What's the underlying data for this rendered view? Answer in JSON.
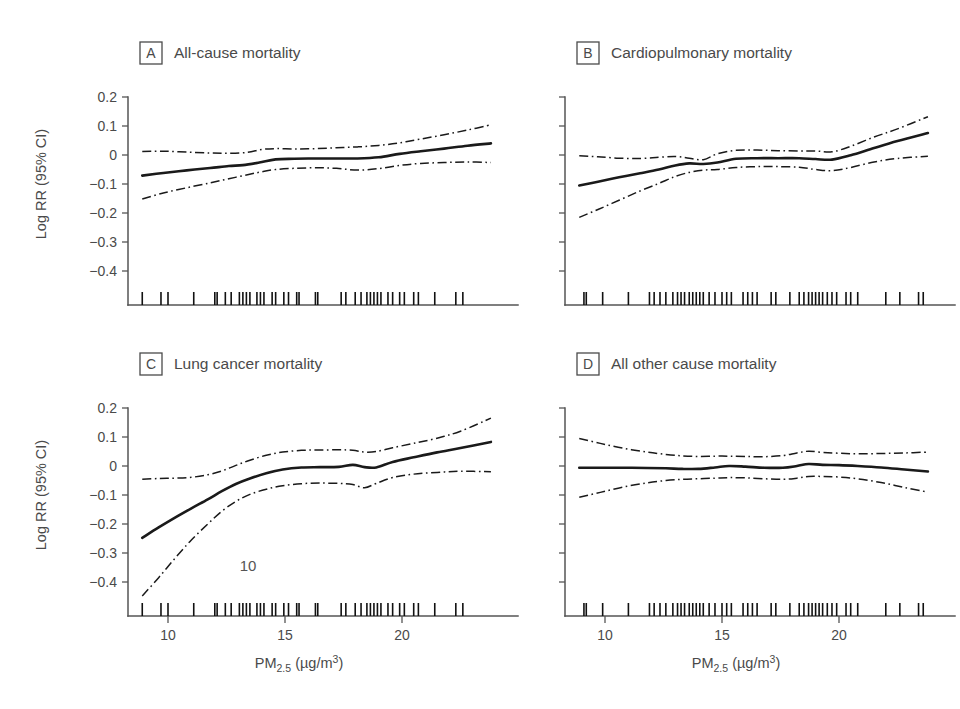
{
  "figure": {
    "background": "#ffffff",
    "line_color": "#1a1a1a",
    "text_color": "#4a4a4a",
    "stray_annotation": "10"
  },
  "axes": {
    "y_label": "Log RR (95% CI)",
    "x_label_main": "PM",
    "x_label_sub": "2.5",
    "x_label_units_open": " (µg/m",
    "x_label_units_sup": "3",
    "x_label_units_close": ")",
    "y_ticks": [
      "0.2",
      "0.1",
      "0",
      "−0.1",
      "−0.2",
      "−0.3",
      "−0.4"
    ],
    "y_tick_values": [
      0.2,
      0.1,
      0,
      -0.1,
      -0.2,
      -0.3,
      -0.4
    ],
    "x_ticks": [
      "10",
      "15",
      "20"
    ],
    "x_tick_values": [
      10,
      15,
      20
    ],
    "ylim": [
      -0.45,
      0.22
    ],
    "xlim": [
      8.4,
      24.4
    ],
    "grid": false,
    "legend": "none"
  },
  "chart_data": [
    {
      "id": "panel-a",
      "tag": "A",
      "title": "All-cause mortality",
      "type": "line",
      "xlabel": "PM2.5 (µg/m3)",
      "ylabel": "Log RR (95% CI)",
      "xlim": [
        8.4,
        24.4
      ],
      "ylim": [
        -0.45,
        0.22
      ],
      "series": [
        {
          "name": "Log RR estimate",
          "style": "solid",
          "x": [
            8.9,
            9.8,
            10.8,
            11.8,
            12.6,
            13.2,
            13.9,
            14.6,
            15.4,
            16.3,
            17.2,
            18.1,
            19.0,
            19.9,
            20.8,
            21.8,
            22.8,
            23.8
          ],
          "y": [
            -0.071,
            -0.062,
            -0.053,
            -0.045,
            -0.038,
            -0.035,
            -0.026,
            -0.015,
            -0.013,
            -0.012,
            -0.012,
            -0.012,
            -0.008,
            0.004,
            0.013,
            0.022,
            0.032,
            0.04
          ]
        },
        {
          "name": "Upper 95% CI",
          "style": "dashdot",
          "x": [
            8.9,
            9.8,
            10.8,
            11.8,
            12.6,
            13.4,
            14.0,
            14.6,
            15.4,
            16.3,
            17.2,
            18.1,
            19.0,
            19.9,
            20.8,
            21.8,
            22.8,
            23.8
          ],
          "y": [
            0.012,
            0.013,
            0.01,
            0.007,
            0.006,
            0.009,
            0.019,
            0.022,
            0.021,
            0.022,
            0.025,
            0.028,
            0.033,
            0.042,
            0.055,
            0.07,
            0.086,
            0.104
          ]
        },
        {
          "name": "Lower 95% CI",
          "style": "dashdot",
          "x": [
            8.9,
            9.8,
            10.8,
            11.8,
            12.6,
            13.4,
            14.0,
            14.6,
            15.4,
            16.3,
            17.2,
            18.1,
            19.0,
            19.9,
            20.8,
            21.8,
            22.8,
            23.8
          ],
          "y": [
            -0.152,
            -0.131,
            -0.113,
            -0.096,
            -0.082,
            -0.068,
            -0.058,
            -0.05,
            -0.046,
            -0.044,
            -0.046,
            -0.052,
            -0.047,
            -0.036,
            -0.029,
            -0.026,
            -0.024,
            -0.026
          ]
        }
      ],
      "rug": [
        8.9,
        9.7,
        10.0,
        11.1,
        12.0,
        12.1,
        12.45,
        12.7,
        13.05,
        13.2,
        13.35,
        13.5,
        13.8,
        13.95,
        14.1,
        14.45,
        14.6,
        14.95,
        15.15,
        15.5,
        15.6,
        16.3,
        16.4,
        17.4,
        17.6,
        18.0,
        18.25,
        18.5,
        18.65,
        18.8,
        18.95,
        19.1,
        19.4,
        19.6,
        19.9,
        20.1,
        20.5,
        20.7,
        21.4,
        22.3,
        22.6
      ]
    },
    {
      "id": "panel-b",
      "tag": "B",
      "title": "Cardiopulmonary mortality",
      "type": "line",
      "xlabel": "PM2.5 (µg/m3)",
      "ylabel": "Log RR (95% CI)",
      "xlim": [
        8.4,
        24.4
      ],
      "ylim": [
        -0.45,
        0.22
      ],
      "series": [
        {
          "name": "Log RR estimate",
          "style": "solid",
          "x": [
            8.9,
            9.7,
            10.6,
            11.5,
            12.3,
            13.0,
            13.6,
            14.2,
            14.8,
            15.6,
            16.5,
            17.4,
            18.3,
            19.0,
            19.7,
            20.5,
            21.5,
            22.5,
            23.8
          ],
          "y": [
            -0.105,
            -0.092,
            -0.077,
            -0.063,
            -0.05,
            -0.036,
            -0.029,
            -0.031,
            -0.026,
            -0.013,
            -0.011,
            -0.011,
            -0.011,
            -0.014,
            -0.016,
            -0.001,
            0.024,
            0.048,
            0.076
          ]
        },
        {
          "name": "Upper 95% CI",
          "style": "dashdot",
          "x": [
            8.9,
            9.7,
            10.6,
            11.5,
            12.3,
            13.0,
            13.6,
            14.2,
            14.8,
            15.6,
            16.5,
            17.4,
            18.3,
            19.0,
            19.7,
            20.5,
            21.5,
            22.5,
            23.8
          ],
          "y": [
            -0.003,
            -0.006,
            -0.011,
            -0.012,
            -0.008,
            -0.005,
            -0.011,
            -0.016,
            0.004,
            0.016,
            0.017,
            0.015,
            0.014,
            0.014,
            0.011,
            0.03,
            0.062,
            0.09,
            0.132
          ]
        },
        {
          "name": "Lower 95% CI",
          "style": "dashdot",
          "x": [
            8.9,
            9.7,
            10.6,
            11.5,
            12.3,
            13.0,
            13.6,
            14.2,
            14.8,
            15.6,
            16.5,
            17.4,
            18.3,
            19.0,
            19.7,
            20.5,
            21.5,
            22.5,
            23.8
          ],
          "y": [
            -0.215,
            -0.188,
            -0.156,
            -0.124,
            -0.098,
            -0.074,
            -0.06,
            -0.052,
            -0.05,
            -0.043,
            -0.04,
            -0.04,
            -0.042,
            -0.05,
            -0.054,
            -0.043,
            -0.024,
            -0.012,
            -0.004
          ]
        }
      ],
      "rug": [
        9.1,
        9.2,
        9.9,
        11.0,
        11.9,
        12.1,
        12.35,
        12.6,
        12.9,
        13.1,
        13.25,
        13.4,
        13.6,
        13.75,
        13.9,
        14.05,
        14.2,
        14.45,
        14.7,
        15.0,
        15.2,
        15.4,
        15.9,
        16.1,
        16.3,
        16.5,
        17.1,
        17.3,
        17.9,
        18.3,
        18.5,
        18.7,
        18.85,
        19.0,
        19.15,
        19.3,
        19.5,
        19.7,
        19.9,
        20.3,
        20.5,
        20.8,
        22.0,
        22.6,
        23.4,
        23.6
      ]
    },
    {
      "id": "panel-c",
      "tag": "C",
      "title": "Lung cancer mortality",
      "type": "line",
      "xlabel": "PM2.5 (µg/m3)",
      "ylabel": "Log RR (95% CI)",
      "xlim": [
        8.4,
        24.4
      ],
      "ylim": [
        -0.45,
        0.22
      ],
      "series": [
        {
          "name": "Log RR estimate",
          "style": "solid",
          "x": [
            8.9,
            9.6,
            10.3,
            11.0,
            11.7,
            12.3,
            12.9,
            13.5,
            14.2,
            14.9,
            15.7,
            16.5,
            17.3,
            17.9,
            18.4,
            18.9,
            19.6,
            20.5,
            21.5,
            22.5,
            23.8
          ],
          "y": [
            -0.248,
            -0.212,
            -0.178,
            -0.146,
            -0.115,
            -0.087,
            -0.062,
            -0.043,
            -0.025,
            -0.012,
            -0.005,
            -0.004,
            -0.003,
            0.004,
            -0.004,
            -0.005,
            0.014,
            0.03,
            0.047,
            0.062,
            0.083
          ]
        },
        {
          "name": "Upper 95% CI",
          "style": "dashdot",
          "x": [
            8.9,
            9.6,
            10.3,
            11.0,
            11.7,
            12.3,
            12.9,
            13.5,
            14.2,
            14.9,
            15.7,
            16.5,
            17.3,
            17.9,
            18.4,
            18.9,
            19.6,
            20.5,
            21.5,
            22.5,
            23.8
          ],
          "y": [
            -0.046,
            -0.043,
            -0.042,
            -0.039,
            -0.03,
            -0.017,
            0.002,
            0.02,
            0.037,
            0.048,
            0.054,
            0.055,
            0.056,
            0.054,
            0.048,
            0.05,
            0.063,
            0.078,
            0.096,
            0.12,
            0.165
          ]
        },
        {
          "name": "Lower 95% CI",
          "style": "dashdot",
          "x": [
            8.9,
            9.6,
            10.3,
            11.0,
            11.7,
            12.3,
            12.9,
            13.5,
            14.2,
            14.9,
            15.7,
            16.5,
            17.3,
            17.9,
            18.4,
            18.9,
            19.6,
            20.5,
            21.5,
            22.5,
            23.8
          ],
          "y": [
            -0.448,
            -0.385,
            -0.318,
            -0.255,
            -0.2,
            -0.156,
            -0.122,
            -0.098,
            -0.08,
            -0.068,
            -0.061,
            -0.059,
            -0.06,
            -0.064,
            -0.075,
            -0.06,
            -0.04,
            -0.028,
            -0.022,
            -0.018,
            -0.02
          ]
        }
      ],
      "rug": [
        8.9,
        9.7,
        10.0,
        11.1,
        12.0,
        12.1,
        12.45,
        12.7,
        13.05,
        13.2,
        13.35,
        13.5,
        13.8,
        13.95,
        14.1,
        14.45,
        14.6,
        14.95,
        15.15,
        15.5,
        15.6,
        16.3,
        16.4,
        17.4,
        17.6,
        18.0,
        18.25,
        18.5,
        18.65,
        18.8,
        18.95,
        19.1,
        19.4,
        19.6,
        19.9,
        20.1,
        20.5,
        20.7,
        21.4,
        22.3,
        22.6
      ],
      "annotation": "10"
    },
    {
      "id": "panel-d",
      "tag": "D",
      "title": "All other cause mortality",
      "type": "line",
      "xlabel": "PM2.5 (µg/m3)",
      "ylabel": "Log RR (95% CI)",
      "xlim": [
        8.4,
        24.4
      ],
      "ylim": [
        -0.45,
        0.22
      ],
      "series": [
        {
          "name": "Log RR estimate",
          "style": "solid",
          "x": [
            8.9,
            9.8,
            10.8,
            11.8,
            12.6,
            13.3,
            14.0,
            14.7,
            15.3,
            16.0,
            16.8,
            17.6,
            18.2,
            18.7,
            19.3,
            20.0,
            20.8,
            21.8,
            22.8,
            23.8
          ],
          "y": [
            -0.006,
            -0.006,
            -0.006,
            -0.007,
            -0.008,
            -0.01,
            -0.01,
            -0.005,
            0.0,
            -0.002,
            -0.006,
            -0.006,
            0.0,
            0.007,
            0.004,
            0.003,
            0.0,
            -0.005,
            -0.012,
            -0.019
          ]
        },
        {
          "name": "Upper 95% CI",
          "style": "dashdot",
          "x": [
            8.9,
            9.8,
            10.8,
            11.8,
            12.6,
            13.3,
            14.0,
            14.7,
            15.3,
            16.0,
            16.8,
            17.6,
            18.2,
            18.7,
            19.3,
            20.0,
            20.8,
            21.8,
            22.8,
            23.8
          ],
          "y": [
            0.095,
            0.078,
            0.061,
            0.048,
            0.04,
            0.035,
            0.033,
            0.034,
            0.034,
            0.033,
            0.032,
            0.036,
            0.045,
            0.051,
            0.047,
            0.044,
            0.042,
            0.043,
            0.045,
            0.048
          ]
        },
        {
          "name": "Lower 95% CI",
          "style": "dashdot",
          "x": [
            8.9,
            9.8,
            10.8,
            11.8,
            12.6,
            13.3,
            14.0,
            14.7,
            15.3,
            16.0,
            16.8,
            17.6,
            18.2,
            18.7,
            19.3,
            20.0,
            20.8,
            21.8,
            22.8,
            23.8
          ],
          "y": [
            -0.108,
            -0.091,
            -0.072,
            -0.058,
            -0.05,
            -0.046,
            -0.044,
            -0.042,
            -0.04,
            -0.041,
            -0.044,
            -0.046,
            -0.042,
            -0.036,
            -0.036,
            -0.038,
            -0.044,
            -0.057,
            -0.074,
            -0.09
          ]
        }
      ],
      "rug": [
        9.1,
        9.2,
        9.9,
        11.0,
        11.9,
        12.1,
        12.35,
        12.6,
        12.9,
        13.1,
        13.25,
        13.4,
        13.6,
        13.75,
        13.9,
        14.05,
        14.2,
        14.45,
        14.7,
        15.0,
        15.2,
        15.4,
        15.9,
        16.1,
        16.3,
        16.5,
        17.1,
        17.3,
        17.9,
        18.3,
        18.5,
        18.7,
        18.85,
        19.0,
        19.15,
        19.3,
        19.5,
        19.7,
        19.9,
        20.3,
        20.5,
        20.8,
        22.0,
        22.6,
        23.4,
        23.6
      ]
    }
  ]
}
